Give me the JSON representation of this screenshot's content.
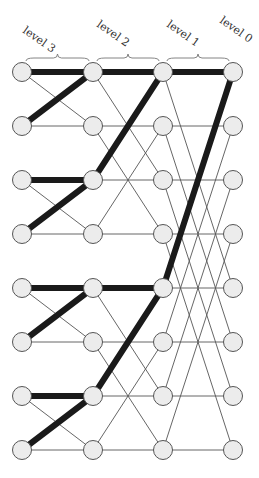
{
  "diagram": {
    "type": "butterfly-network",
    "levels": [
      {
        "label": "level 3",
        "x": 22
      },
      {
        "label": "level 2",
        "x": 93
      },
      {
        "label": "level 1",
        "x": 163
      },
      {
        "label": "level 0",
        "x": 233
      }
    ],
    "rows_y": [
      72,
      126,
      180,
      234,
      288,
      342,
      396,
      450
    ],
    "node_radius": 9.5,
    "stage_xor": [
      1,
      2,
      4
    ],
    "highlighted_edges": [
      {
        "stage": 0,
        "from_row": 0,
        "to_row": 0
      },
      {
        "stage": 0,
        "from_row": 1,
        "to_row": 0
      },
      {
        "stage": 0,
        "from_row": 2,
        "to_row": 2
      },
      {
        "stage": 0,
        "from_row": 3,
        "to_row": 2
      },
      {
        "stage": 0,
        "from_row": 4,
        "to_row": 4
      },
      {
        "stage": 0,
        "from_row": 5,
        "to_row": 4
      },
      {
        "stage": 0,
        "from_row": 6,
        "to_row": 6
      },
      {
        "stage": 0,
        "from_row": 7,
        "to_row": 6
      },
      {
        "stage": 1,
        "from_row": 0,
        "to_row": 0
      },
      {
        "stage": 1,
        "from_row": 2,
        "to_row": 0
      },
      {
        "stage": 1,
        "from_row": 4,
        "to_row": 4
      },
      {
        "stage": 1,
        "from_row": 6,
        "to_row": 4
      },
      {
        "stage": 2,
        "from_row": 0,
        "to_row": 0
      },
      {
        "stage": 2,
        "from_row": 4,
        "to_row": 0
      }
    ],
    "colors": {
      "node_fill": "#ececec",
      "node_stroke": "#555555",
      "edge": "#555555",
      "highlight": "#1a1a1a"
    }
  }
}
